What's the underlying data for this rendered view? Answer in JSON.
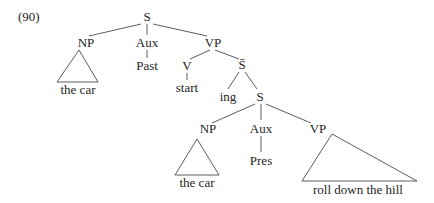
{
  "example_number": "(90)",
  "tree": {
    "root": "S",
    "np_subject": {
      "label": "NP",
      "yield": "the car"
    },
    "aux": {
      "label": "Aux",
      "value": "Past"
    },
    "vp": {
      "label": "VP",
      "verb": {
        "label": "V",
        "value": "start"
      },
      "sbar": {
        "label": "S̄",
        "complementizer": "ing",
        "s": {
          "label": "S",
          "np": {
            "label": "NP",
            "yield": "the car"
          },
          "aux": {
            "label": "Aux",
            "value": "Pres"
          },
          "vp": {
            "label": "VP",
            "yield": "roll down the hill"
          }
        }
      }
    }
  }
}
